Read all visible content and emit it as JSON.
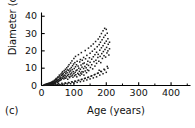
{
  "chart_data": {
    "type": "scatter",
    "title": "",
    "panel_label": "(c)",
    "xlabel": "Age (years)",
    "ylabel": "Diameter (cm)",
    "xlim": [
      0,
      460
    ],
    "ylim": [
      0,
      41
    ],
    "grid": false,
    "legend": null,
    "marker": "square",
    "marker_color": "#1a1a1a",
    "axis_color": "#000000",
    "background": "#ffffff",
    "xticks": [
      0,
      100,
      200,
      300,
      400
    ],
    "xtick_labels": [
      "0",
      "100",
      "200",
      "300",
      "400"
    ],
    "x_minor_ticks": [
      50,
      150,
      250,
      350,
      450
    ],
    "yticks": [
      0,
      10,
      20,
      30,
      40
    ],
    "ytick_labels": [
      "0",
      "10",
      "20",
      "30",
      "40"
    ],
    "points": [
      [
        8,
        0.4
      ],
      [
        10,
        0.3
      ],
      [
        12,
        0.6
      ],
      [
        14,
        0.5
      ],
      [
        15,
        0.8
      ],
      [
        16,
        0.4
      ],
      [
        17,
        0.9
      ],
      [
        18,
        0.6
      ],
      [
        19,
        1.0
      ],
      [
        20,
        0.7
      ],
      [
        21,
        1.2
      ],
      [
        22,
        0.9
      ],
      [
        23,
        0.5
      ],
      [
        24,
        1.4
      ],
      [
        25,
        1.0
      ],
      [
        26,
        0.8
      ],
      [
        27,
        1.6
      ],
      [
        28,
        1.1
      ],
      [
        29,
        0.9
      ],
      [
        30,
        1.8
      ],
      [
        30,
        0.6
      ],
      [
        31,
        1.3
      ],
      [
        32,
        2.0
      ],
      [
        33,
        1.1
      ],
      [
        34,
        1.7
      ],
      [
        35,
        2.4
      ],
      [
        35,
        0.9
      ],
      [
        36,
        1.5
      ],
      [
        37,
        2.1
      ],
      [
        38,
        1.2
      ],
      [
        39,
        2.6
      ],
      [
        40,
        1.8
      ],
      [
        40,
        3.0
      ],
      [
        41,
        1.4
      ],
      [
        42,
        2.3
      ],
      [
        43,
        3.4
      ],
      [
        44,
        1.9
      ],
      [
        45,
        2.8
      ],
      [
        45,
        4.0
      ],
      [
        46,
        2.2
      ],
      [
        47,
        3.6
      ],
      [
        48,
        2.5
      ],
      [
        49,
        4.4
      ],
      [
        50,
        3.0
      ],
      [
        50,
        1.8
      ],
      [
        51,
        5.0
      ],
      [
        52,
        3.3
      ],
      [
        53,
        2.4
      ],
      [
        54,
        4.8
      ],
      [
        55,
        3.8
      ],
      [
        55,
        6.0
      ],
      [
        56,
        2.9
      ],
      [
        57,
        5.4
      ],
      [
        58,
        4.2
      ],
      [
        59,
        3.1
      ],
      [
        60,
        6.6
      ],
      [
        60,
        4.6
      ],
      [
        61,
        3.5
      ],
      [
        62,
        5.8
      ],
      [
        63,
        7.2
      ],
      [
        64,
        4.1
      ],
      [
        65,
        6.2
      ],
      [
        65,
        8.0
      ],
      [
        66,
        4.9
      ],
      [
        67,
        7.0
      ],
      [
        68,
        5.3
      ],
      [
        69,
        3.8
      ],
      [
        70,
        8.6
      ],
      [
        70,
        6.0
      ],
      [
        71,
        4.4
      ],
      [
        72,
        7.6
      ],
      [
        73,
        5.6
      ],
      [
        74,
        9.4
      ],
      [
        75,
        6.8
      ],
      [
        75,
        4.2
      ],
      [
        76,
        8.2
      ],
      [
        77,
        5.0
      ],
      [
        78,
        10.2
      ],
      [
        79,
        7.4
      ],
      [
        80,
        5.8
      ],
      [
        80,
        9.0
      ],
      [
        81,
        3.6
      ],
      [
        82,
        11.0
      ],
      [
        83,
        6.4
      ],
      [
        84,
        8.8
      ],
      [
        85,
        5.2
      ],
      [
        85,
        12.0
      ],
      [
        86,
        7.8
      ],
      [
        87,
        4.6
      ],
      [
        88,
        9.6
      ],
      [
        89,
        6.6
      ],
      [
        90,
        13.0
      ],
      [
        90,
        8.4
      ],
      [
        91,
        5.4
      ],
      [
        92,
        10.4
      ],
      [
        93,
        7.2
      ],
      [
        94,
        14.2
      ],
      [
        95,
        9.2
      ],
      [
        95,
        6.0
      ],
      [
        96,
        11.4
      ],
      [
        97,
        4.8
      ],
      [
        98,
        8.0
      ],
      [
        99,
        12.4
      ],
      [
        100,
        15.6
      ],
      [
        100,
        6.8
      ],
      [
        101,
        9.8
      ],
      [
        102,
        5.6
      ],
      [
        103,
        13.2
      ],
      [
        104,
        7.6
      ],
      [
        105,
        10.8
      ],
      [
        105,
        16.8
      ],
      [
        106,
        6.2
      ],
      [
        107,
        8.6
      ],
      [
        108,
        12.0
      ],
      [
        109,
        5.0
      ],
      [
        110,
        14.0
      ],
      [
        110,
        9.0
      ],
      [
        112,
        7.0
      ],
      [
        113,
        11.2
      ],
      [
        114,
        17.8
      ],
      [
        115,
        6.4
      ],
      [
        115,
        10.0
      ],
      [
        117,
        8.2
      ],
      [
        118,
        13.6
      ],
      [
        119,
        5.8
      ],
      [
        120,
        15.0
      ],
      [
        120,
        9.4
      ],
      [
        121,
        7.2
      ],
      [
        122,
        11.8
      ],
      [
        123,
        19.0
      ],
      [
        124,
        6.6
      ],
      [
        125,
        10.6
      ],
      [
        125,
        8.0
      ],
      [
        126,
        14.6
      ],
      [
        128,
        12.6
      ],
      [
        129,
        7.8
      ],
      [
        130,
        16.2
      ],
      [
        130,
        9.8
      ],
      [
        131,
        6.0
      ],
      [
        132,
        13.0
      ],
      [
        134,
        11.0
      ],
      [
        135,
        20.2
      ],
      [
        135,
        8.4
      ],
      [
        136,
        15.4
      ],
      [
        138,
        10.2
      ],
      [
        139,
        7.4
      ],
      [
        140,
        17.4
      ],
      [
        140,
        12.2
      ],
      [
        142,
        9.0
      ],
      [
        143,
        14.0
      ],
      [
        145,
        21.6
      ],
      [
        145,
        11.6
      ],
      [
        146,
        8.6
      ],
      [
        148,
        16.0
      ],
      [
        150,
        18.6
      ],
      [
        150,
        13.4
      ],
      [
        151,
        10.4
      ],
      [
        153,
        22.8
      ],
      [
        155,
        15.2
      ],
      [
        155,
        12.0
      ],
      [
        157,
        19.8
      ],
      [
        158,
        9.6
      ],
      [
        160,
        24.0
      ],
      [
        160,
        16.6
      ],
      [
        162,
        13.8
      ],
      [
        164,
        21.0
      ],
      [
        165,
        11.2
      ],
      [
        165,
        17.8
      ],
      [
        167,
        25.4
      ],
      [
        168,
        14.6
      ],
      [
        170,
        19.2
      ],
      [
        170,
        12.8
      ],
      [
        172,
        22.4
      ],
      [
        174,
        16.2
      ],
      [
        175,
        26.8
      ],
      [
        175,
        18.0
      ],
      [
        177,
        14.0
      ],
      [
        178,
        23.6
      ],
      [
        180,
        28.2
      ],
      [
        180,
        20.4
      ],
      [
        181,
        16.8
      ],
      [
        182,
        25.0
      ],
      [
        183,
        13.2
      ],
      [
        185,
        30.0
      ],
      [
        185,
        21.8
      ],
      [
        186,
        18.4
      ],
      [
        187,
        26.4
      ],
      [
        188,
        15.6
      ],
      [
        190,
        31.6
      ],
      [
        190,
        23.0
      ],
      [
        191,
        19.6
      ],
      [
        192,
        27.8
      ],
      [
        193,
        17.2
      ],
      [
        195,
        33.0
      ],
      [
        195,
        24.4
      ],
      [
        196,
        20.8
      ],
      [
        197,
        29.0
      ],
      [
        198,
        16.4
      ],
      [
        200,
        32.4
      ],
      [
        200,
        25.6
      ],
      [
        201,
        22.0
      ],
      [
        202,
        18.8
      ],
      [
        203,
        30.2
      ],
      [
        205,
        27.0
      ],
      [
        205,
        20.0
      ],
      [
        206,
        23.8
      ],
      [
        208,
        17.6
      ],
      [
        210,
        25.0
      ],
      [
        210,
        21.2
      ],
      [
        70,
        0.8
      ],
      [
        75,
        1.2
      ],
      [
        80,
        0.9
      ],
      [
        85,
        1.6
      ],
      [
        90,
        1.0
      ],
      [
        95,
        2.0
      ],
      [
        100,
        1.4
      ],
      [
        105,
        2.4
      ],
      [
        110,
        1.8
      ],
      [
        115,
        3.0
      ],
      [
        120,
        2.2
      ],
      [
        125,
        3.6
      ],
      [
        130,
        2.6
      ],
      [
        135,
        4.2
      ],
      [
        140,
        3.2
      ],
      [
        145,
        4.8
      ],
      [
        150,
        3.8
      ],
      [
        155,
        5.6
      ],
      [
        160,
        4.4
      ],
      [
        165,
        6.4
      ],
      [
        170,
        5.0
      ],
      [
        175,
        7.2
      ],
      [
        180,
        6.0
      ],
      [
        185,
        8.0
      ],
      [
        190,
        6.8
      ],
      [
        195,
        9.0
      ],
      [
        200,
        7.6
      ],
      [
        205,
        10.0
      ],
      [
        178,
        8.8
      ],
      [
        60,
        0.5
      ],
      [
        65,
        0.7
      ],
      [
        55,
        0.4
      ],
      [
        50,
        0.5
      ],
      [
        45,
        0.6
      ],
      [
        42,
        0.4
      ],
      [
        38,
        0.5
      ],
      [
        36,
        0.7
      ],
      [
        33,
        0.4
      ],
      [
        31,
        0.5
      ],
      [
        28,
        0.4
      ],
      [
        26,
        0.6
      ],
      [
        24,
        0.3
      ],
      [
        22,
        0.4
      ],
      [
        20,
        0.3
      ],
      [
        18,
        0.4
      ],
      [
        16,
        0.3
      ],
      [
        14,
        0.2
      ],
      [
        12,
        0.3
      ],
      [
        10,
        0.2
      ],
      [
        9,
        0.4
      ],
      [
        11,
        0.5
      ],
      [
        13,
        0.4
      ],
      [
        17,
        0.6
      ],
      [
        23,
        0.8
      ],
      [
        29,
        0.7
      ],
      [
        37,
        0.9
      ],
      [
        43,
        1.0
      ],
      [
        53,
        1.1
      ],
      [
        63,
        1.3
      ],
      [
        73,
        1.5
      ],
      [
        83,
        1.7
      ],
      [
        93,
        2.1
      ],
      [
        103,
        2.5
      ],
      [
        113,
        2.9
      ],
      [
        123,
        3.4
      ],
      [
        133,
        4.0
      ],
      [
        143,
        4.6
      ],
      [
        153,
        5.4
      ],
      [
        163,
        6.2
      ],
      [
        173,
        7.0
      ],
      [
        183,
        8.2
      ],
      [
        193,
        9.4
      ],
      [
        203,
        11.0
      ]
    ]
  }
}
